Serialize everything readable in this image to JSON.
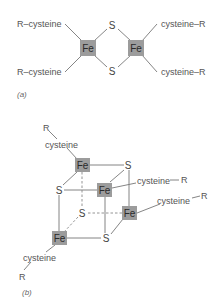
{
  "panel_a": {
    "caption": "(a)",
    "left_ligands": [
      "R–cysteine",
      "R–cysteine"
    ],
    "right_ligands": [
      "cysteine–R",
      "cysteine–R"
    ],
    "iron_atoms": [
      "Fe",
      "Fe"
    ],
    "sulfur_atoms": [
      "S",
      "S"
    ]
  },
  "panel_b": {
    "caption": "(b)",
    "iron_atoms": [
      "Fe",
      "Fe",
      "Fe",
      "Fe"
    ],
    "sulfur_atoms": [
      "S",
      "S",
      "S",
      "S"
    ],
    "ligands": [
      {
        "cysteine": "cysteine",
        "r": "R"
      },
      {
        "cysteine": "cysteine",
        "r": "R"
      },
      {
        "cysteine": "cysteine",
        "r": "R"
      },
      {
        "cysteine": "cysteine",
        "r": "R"
      }
    ]
  },
  "colors": {
    "iron_box": "#9c9c9c",
    "bond": "#777777",
    "text": "#555555"
  }
}
